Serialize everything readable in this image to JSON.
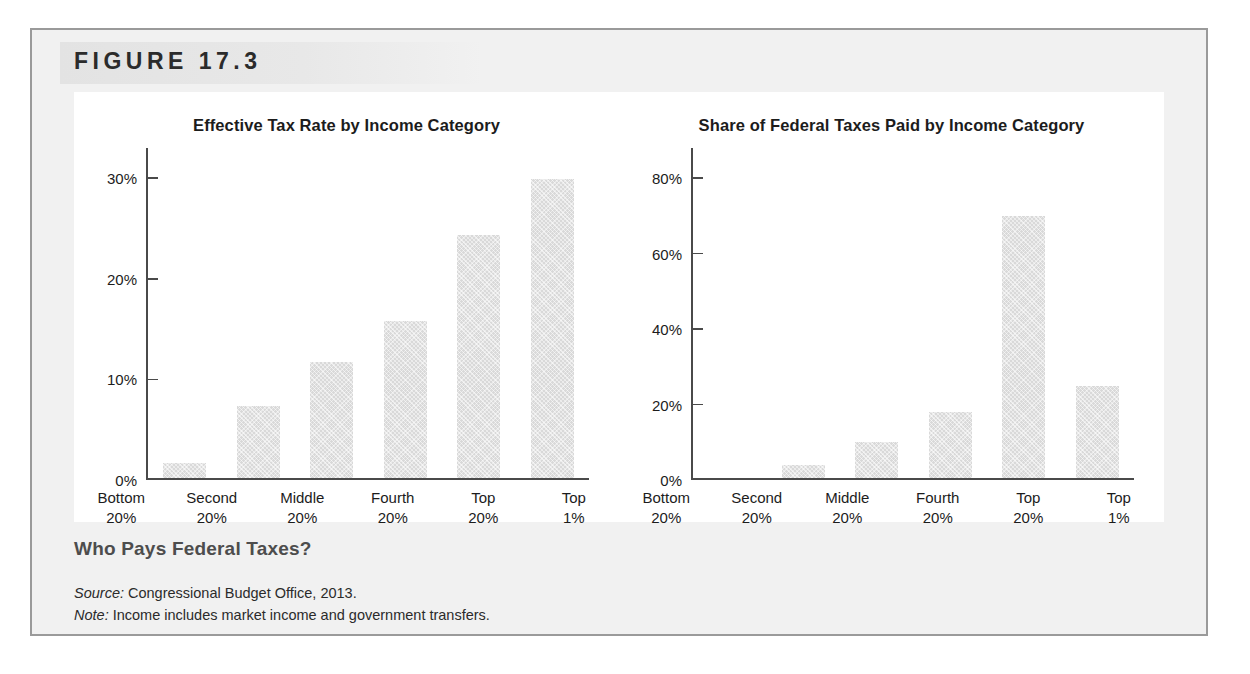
{
  "figure": {
    "label": "FIGURE 17.3",
    "caption": "Who Pays Federal Taxes?",
    "source_lead": "Source:",
    "source_text": " Congressional Budget Office, 2013.",
    "note_lead": "Note:",
    "note_text": " Income includes market income and government transfers."
  },
  "colors": {
    "page_background": "#ffffff",
    "figure_background": "#f1f1f1",
    "figure_border": "#9a9a9a",
    "header_band": "#e3e3e3",
    "panel_background": "#ffffff",
    "bar_fill": "#d9d9d9",
    "axis": "#4a4a4a",
    "text": "#1c1c1c",
    "caption_text": "#4d4d4d"
  },
  "chart_data": [
    {
      "type": "bar",
      "title": "Effective Tax Rate by Income Category",
      "xlabel": "",
      "ylabel": "",
      "categories": [
        "Bottom 20%",
        "Second 20%",
        "Middle 20%",
        "Fourth 20%",
        "Top 20%",
        "Top 1%"
      ],
      "category_lines": [
        [
          "Bottom",
          "20%"
        ],
        [
          "Second",
          "20%"
        ],
        [
          "Middle",
          "20%"
        ],
        [
          "Fourth",
          "20%"
        ],
        [
          "Top",
          "20%"
        ],
        [
          "Top",
          "1%"
        ]
      ],
      "values": [
        1.5,
        7.2,
        11.6,
        15.6,
        24.2,
        29.7
      ],
      "ylim": [
        0,
        33
      ],
      "yticks": [
        0,
        10,
        20,
        30
      ],
      "ytick_labels": [
        "0%",
        "10%",
        "20%",
        "30%"
      ],
      "grid": false,
      "legend": "none"
    },
    {
      "type": "bar",
      "title": "Share of Federal Taxes Paid by Income Category",
      "xlabel": "",
      "ylabel": "",
      "categories": [
        "Bottom 20%",
        "Second 20%",
        "Middle 20%",
        "Fourth 20%",
        "Top 20%",
        "Top 1%"
      ],
      "category_lines": [
        [
          "Bottom",
          "20%"
        ],
        [
          "Second",
          "20%"
        ],
        [
          "Middle",
          "20%"
        ],
        [
          "Fourth",
          "20%"
        ],
        [
          "Top",
          "20%"
        ],
        [
          "Top",
          "1%"
        ]
      ],
      "values": [
        0.0,
        3.5,
        9.6,
        17.6,
        69.4,
        24.4
      ],
      "ylim": [
        0,
        88
      ],
      "yticks": [
        0,
        20,
        40,
        60,
        80
      ],
      "ytick_labels": [
        "0%",
        "20%",
        "40%",
        "60%",
        "80%"
      ],
      "grid": false,
      "legend": "none"
    }
  ]
}
